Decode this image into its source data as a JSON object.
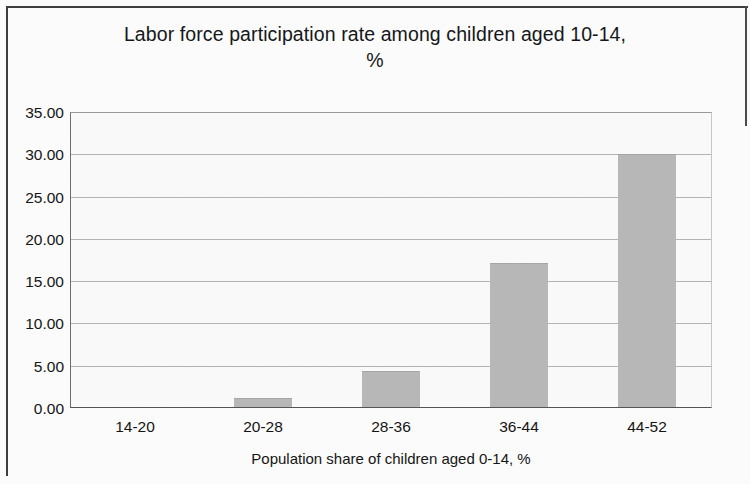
{
  "chart_data": {
    "type": "bar",
    "title": "Labor force participation rate among children aged 10-14, %",
    "title_line1": "Labor force participation rate among children aged 10-14,",
    "title_line2": "%",
    "xlabel": "Population share of children aged 0-14, %",
    "ylabel": "",
    "categories": [
      "14-20",
      "20-28",
      "28-36",
      "36-44",
      "44-52"
    ],
    "values": [
      0.0,
      1.1,
      4.3,
      17.2,
      30.1
    ],
    "ylim": [
      0,
      35
    ],
    "ytick_step": 5,
    "ytick_labels": [
      "0.00",
      "5.00",
      "10.00",
      "15.00",
      "20.00",
      "25.00",
      "30.00",
      "35.00"
    ],
    "ytick_values": [
      0,
      5,
      10,
      15,
      20,
      25,
      30,
      35
    ],
    "grid": true,
    "grid_axis": "y",
    "legend": false,
    "legend_position": "none",
    "bar_color": "#b9b9b9",
    "plot_background": "#fbfbfb",
    "gridline_color": "#b5b5b5",
    "axis_color": "#555555",
    "text_color": "#151515"
  }
}
